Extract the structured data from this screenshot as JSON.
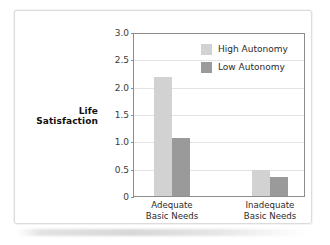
{
  "figure": {
    "background_color": "#ffffff",
    "frame_color": "#dcdcdc"
  },
  "chart_data": {
    "type": "bar",
    "title": "",
    "subtitle": "",
    "xlabel": "",
    "ylabel": "Life Satisfaction",
    "ylim": [
      0,
      3.0
    ],
    "yticks": [
      "0",
      "0.5",
      "1.0",
      "1.5",
      "2.0",
      "2.5",
      "3.0"
    ],
    "ytick_values": [
      0,
      0.5,
      1.0,
      1.5,
      2.0,
      2.5,
      3.0
    ],
    "grid": "horizontal",
    "legend_position": "top-right",
    "categories": [
      {
        "line1": "Adequate",
        "line2": "Basic Needs"
      },
      {
        "line1": "Inadequate",
        "line2": "Basic Needs"
      }
    ],
    "series": [
      {
        "name": "High Autonomy",
        "color": "#d2d2d2",
        "values": [
          2.2,
          0.48
        ]
      },
      {
        "name": "Low Autonomy",
        "color": "#9a9a9a",
        "values": [
          1.08,
          0.36
        ]
      }
    ]
  }
}
